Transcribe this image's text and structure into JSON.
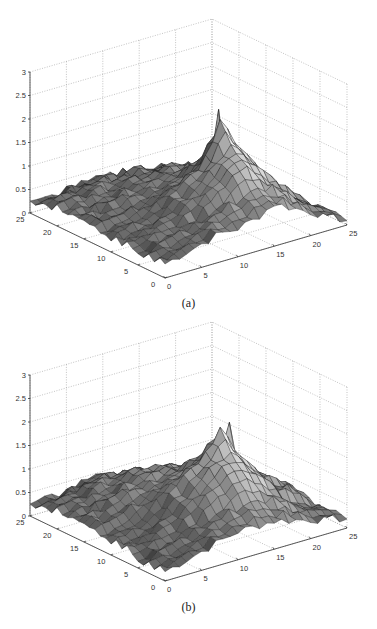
{
  "figures": [
    {
      "caption": "(a)",
      "chart_data": {
        "type": "surface3d",
        "title": "",
        "xlabel": "",
        "ylabel": "",
        "zlabel": "",
        "xlim": [
          0,
          25
        ],
        "ylim": [
          0,
          25
        ],
        "zlim": [
          0,
          3
        ],
        "x_ticks": [
          "0",
          "5",
          "10",
          "15",
          "20",
          "25"
        ],
        "y_ticks": [
          "0",
          "5",
          "10",
          "15",
          "20",
          "25"
        ],
        "z_ticks": [
          "0",
          "0.5",
          "1",
          "1.5",
          "2",
          "2.5",
          "3"
        ],
        "grid": true,
        "colormap": "gray",
        "peak": {
          "x": 17,
          "y": 13,
          "z": 2.1
        },
        "grid_step": 2.5,
        "z_grid_rows_y_from_0_to_25": [
          [
            0.3,
            0.4,
            0.5,
            0.6,
            0.6,
            0.7,
            0.9,
            0.7,
            0.5,
            0.3,
            0.1
          ],
          [
            0.3,
            0.4,
            0.5,
            0.6,
            0.8,
            0.9,
            1.0,
            0.9,
            0.6,
            0.3,
            0.1
          ],
          [
            0.3,
            0.4,
            0.5,
            0.6,
            0.9,
            1.2,
            1.4,
            1.1,
            0.7,
            0.4,
            0.1
          ],
          [
            0.3,
            0.4,
            0.5,
            0.7,
            1.0,
            1.3,
            1.7,
            1.3,
            0.8,
            0.4,
            0.1
          ],
          [
            0.3,
            0.4,
            0.5,
            0.7,
            1.0,
            1.3,
            2.1,
            1.4,
            0.8,
            0.4,
            0.1
          ],
          [
            0.3,
            0.4,
            0.5,
            0.6,
            0.8,
            1.0,
            1.3,
            1.0,
            0.6,
            0.3,
            0.1
          ],
          [
            0.4,
            0.4,
            0.5,
            0.6,
            0.7,
            0.8,
            0.9,
            0.7,
            0.5,
            0.3,
            0.1
          ],
          [
            0.4,
            0.4,
            0.5,
            0.6,
            0.6,
            0.7,
            0.7,
            0.6,
            0.4,
            0.2,
            0.1
          ],
          [
            0.4,
            0.5,
            0.5,
            0.5,
            0.6,
            0.6,
            0.6,
            0.5,
            0.3,
            0.2,
            0.1
          ],
          [
            0.3,
            0.4,
            0.4,
            0.5,
            0.5,
            0.5,
            0.4,
            0.3,
            0.2,
            0.1,
            0.1
          ],
          [
            0.2,
            0.2,
            0.3,
            0.3,
            0.3,
            0.3,
            0.2,
            0.2,
            0.1,
            0.1,
            0.0
          ]
        ]
      }
    },
    {
      "caption": "(b)",
      "chart_data": {
        "type": "surface3d",
        "title": "",
        "xlabel": "",
        "ylabel": "",
        "zlabel": "",
        "xlim": [
          0,
          25
        ],
        "ylim": [
          0,
          25
        ],
        "zlim": [
          0,
          3
        ],
        "x_ticks": [
          "0",
          "5",
          "10",
          "15",
          "20",
          "25"
        ],
        "y_ticks": [
          "0",
          "5",
          "10",
          "15",
          "20",
          "25"
        ],
        "z_ticks": [
          "0",
          "0.5",
          "1",
          "1.5",
          "2",
          "2.5",
          "3"
        ],
        "grid": true,
        "colormap": "gray",
        "peak": {
          "x": 17,
          "y": 11,
          "z": 2.0
        },
        "grid_step": 2.5,
        "z_grid_rows_y_from_0_to_25": [
          [
            0.2,
            0.3,
            0.4,
            0.5,
            0.6,
            0.6,
            0.6,
            0.5,
            0.4,
            0.3,
            0.2
          ],
          [
            0.2,
            0.3,
            0.4,
            0.5,
            0.7,
            0.8,
            0.8,
            0.7,
            0.5,
            0.3,
            0.2
          ],
          [
            0.2,
            0.3,
            0.4,
            0.6,
            0.9,
            1.1,
            1.2,
            1.0,
            0.6,
            0.4,
            0.2
          ],
          [
            0.3,
            0.3,
            0.5,
            0.7,
            1.1,
            1.4,
            1.6,
            1.2,
            0.8,
            0.6,
            0.3
          ],
          [
            0.3,
            0.3,
            0.5,
            0.8,
            1.2,
            1.5,
            2.0,
            1.3,
            0.8,
            0.6,
            0.3
          ],
          [
            0.3,
            0.4,
            0.6,
            0.8,
            1.0,
            1.2,
            1.4,
            1.1,
            0.7,
            0.5,
            0.2
          ],
          [
            0.4,
            0.5,
            0.7,
            0.8,
            0.9,
            1.0,
            1.0,
            0.8,
            0.6,
            0.4,
            0.2
          ],
          [
            0.4,
            0.5,
            0.6,
            0.8,
            0.9,
            0.9,
            0.8,
            0.6,
            0.4,
            0.3,
            0.1
          ],
          [
            0.4,
            0.5,
            0.6,
            0.7,
            0.8,
            0.7,
            0.6,
            0.5,
            0.3,
            0.2,
            0.1
          ],
          [
            0.3,
            0.4,
            0.5,
            0.6,
            0.6,
            0.5,
            0.4,
            0.3,
            0.2,
            0.1,
            0.1
          ],
          [
            0.2,
            0.3,
            0.3,
            0.4,
            0.4,
            0.3,
            0.3,
            0.2,
            0.1,
            0.1,
            0.0
          ]
        ]
      }
    }
  ]
}
